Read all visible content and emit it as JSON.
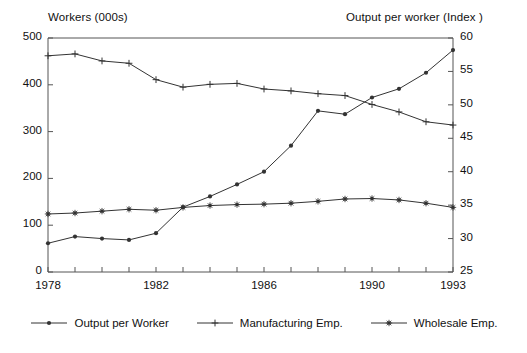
{
  "chart_data": {
    "type": "line",
    "title": "",
    "xlabel": "",
    "ylabel": "Workers (000s)",
    "y2label": "Output per worker (Index )",
    "grid": false,
    "legend_position": "bottom",
    "x": [
      1978,
      1979,
      1980,
      1981,
      1982,
      1983,
      1984,
      1985,
      1986,
      1987,
      1988,
      1989,
      1990,
      1991,
      1992,
      1993
    ],
    "xlim": [
      1978,
      1993
    ],
    "xticks": [
      1978,
      1979,
      1980,
      1981,
      1982,
      1983,
      1984,
      1985,
      1986,
      1987,
      1988,
      1989,
      1990,
      1991,
      1992,
      1993
    ],
    "xticklabels": [
      "1978",
      "",
      "",
      "",
      "1982",
      "",
      "",
      "",
      "1986",
      "",
      "",
      "",
      "1990",
      "",
      "",
      "1993"
    ],
    "ylim": [
      0,
      500
    ],
    "yticks": [
      0,
      100,
      200,
      300,
      400,
      500
    ],
    "yticklabels": [
      "0",
      "100",
      "200",
      "300",
      "400",
      "500"
    ],
    "y2lim": [
      25,
      60
    ],
    "y2ticks": [
      25,
      30,
      35,
      40,
      45,
      50,
      55,
      60
    ],
    "y2ticklabels": [
      "25",
      "30",
      "35",
      "40",
      "45",
      "50",
      "55",
      "60"
    ],
    "series": [
      {
        "name": "Output per Worker",
        "marker": "dot",
        "axis": "right",
        "values": [
          29.3,
          30.3,
          30.0,
          29.8,
          30.8,
          34.7,
          36.3,
          38.1,
          40.0,
          43.9,
          49.1,
          48.6,
          51.1,
          52.4,
          54.8,
          58.2
        ]
      },
      {
        "name": "Manufacturing Emp.",
        "marker": "plus",
        "axis": "left",
        "values": [
          462,
          466,
          451,
          446,
          411,
          395,
          401,
          403,
          391,
          387,
          381,
          377,
          358,
          342,
          321,
          314
        ]
      },
      {
        "name": "Wholesale Emp.",
        "marker": "star",
        "axis": "left",
        "values": [
          124,
          126,
          130,
          134,
          132,
          138,
          142,
          144,
          145,
          147,
          151,
          156,
          157,
          154,
          147,
          138
        ]
      }
    ]
  },
  "legend": {
    "items": [
      {
        "label": "Output per Worker",
        "marker": "dot"
      },
      {
        "label": "Manufacturing Emp.",
        "marker": "plus"
      },
      {
        "label": "Wholesale Emp.",
        "marker": "star"
      }
    ]
  },
  "colors": {
    "line": "#333333",
    "axis": "#555555",
    "text": "#111111",
    "background": "#ffffff"
  }
}
